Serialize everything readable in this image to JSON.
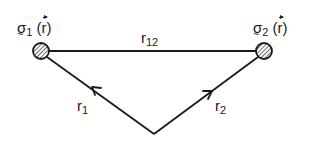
{
  "diagram": {
    "nodes": [
      {
        "id": "sigma1",
        "symbol": "σ",
        "subscript": "1",
        "argument": "r",
        "cx": 41,
        "cy": 51,
        "r": 8,
        "fill": "hatched"
      },
      {
        "id": "sigma2",
        "symbol": "σ",
        "subscript": "2",
        "argument": "r",
        "cx": 264,
        "cy": 51,
        "r": 8,
        "fill": "hatched"
      }
    ],
    "origin": {
      "x": 154,
      "y": 134
    },
    "edges": [
      {
        "id": "r12",
        "label": "r",
        "subscript": "12",
        "from": "sigma1",
        "to": "sigma2",
        "arrow": false
      },
      {
        "id": "r1",
        "label": "r",
        "subscript": "1",
        "from": "origin",
        "to": "sigma1",
        "arrow": true
      },
      {
        "id": "r2",
        "label": "r",
        "subscript": "2",
        "from": "origin",
        "to": "sigma2",
        "arrow": true
      }
    ],
    "stroke_color": "#1a1a1a",
    "background": "#ffffff"
  },
  "labels": {
    "sigma1": {
      "symbol": "σ",
      "sub": "1",
      "open": "(",
      "arg": "r",
      "close": ")"
    },
    "sigma2": {
      "symbol": "σ",
      "sub": "2",
      "open": "(",
      "arg": "r",
      "close": ")"
    },
    "r12": {
      "main": "r",
      "sub": "12"
    },
    "r1": {
      "main": "r",
      "sub": "1"
    },
    "r2": {
      "main": "r",
      "sub": "2"
    }
  }
}
